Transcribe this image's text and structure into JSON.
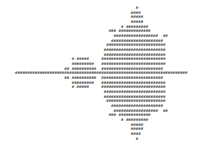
{
  "art": {
    "description": "ASCII-art Mandelbrot set rendered with # characters",
    "rows": [
      "                                                 #",
      "                                               ####",
      "                                               #####",
      "                                               #####",
      "                                           # #########",
      "                                      ### #############",
      "                                        ##################  ##",
      "                                       #####################",
      "                                     ########################",
      "                                    #########################",
      "                                    #########################",
      "                       # #####     ##########################",
      "                       #########   ##########################",
      "                    ## ##########  #########################",
      "######################################################################",
      "                    ## ##########  #########################",
      "                       #########   ##########################",
      "                       # #####     ##########################",
      "                                    #########################",
      "                                    #########################",
      "                                     ########################",
      "                                       #####################",
      "                                        ##################  ##",
      "                                      ### #############",
      "                                           # #########",
      "                                               #####",
      "                                               #####",
      "                                               ####",
      "                                                 #"
    ]
  }
}
